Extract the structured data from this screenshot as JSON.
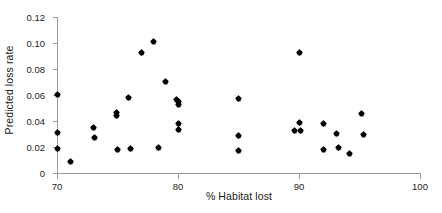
{
  "chart_data": {
    "type": "scatter",
    "title": "",
    "xlabel": "% Habitat lost",
    "ylabel": "Predicted loss rate",
    "xlim": [
      70,
      100
    ],
    "ylim": [
      0,
      0.12
    ],
    "grid": false,
    "legend": null,
    "xticks": [
      70,
      80,
      90,
      100
    ],
    "xtick_labels": [
      "70",
      "80",
      "90",
      "100"
    ],
    "yticks": [
      0,
      0.02,
      0.04,
      0.06,
      0.08,
      0.1,
      0.12
    ],
    "ytick_labels": [
      "0",
      "0.02",
      "0.04",
      "0.06",
      "0.08",
      "0.10",
      "0.12"
    ],
    "marker": "diamond",
    "marker_color": "#000000",
    "axis_color": "#9a9a9a",
    "points": [
      {
        "x": 70.0,
        "y": 0.0605
      },
      {
        "x": 70.0,
        "y": 0.031
      },
      {
        "x": 70.0,
        "y": 0.019
      },
      {
        "x": 71.1,
        "y": 0.0088
      },
      {
        "x": 73.0,
        "y": 0.0353
      },
      {
        "x": 73.1,
        "y": 0.0273
      },
      {
        "x": 74.9,
        "y": 0.0463
      },
      {
        "x": 74.9,
        "y": 0.0443
      },
      {
        "x": 75.0,
        "y": 0.0177
      },
      {
        "x": 75.9,
        "y": 0.0578
      },
      {
        "x": 76.1,
        "y": 0.0188
      },
      {
        "x": 77.0,
        "y": 0.0928
      },
      {
        "x": 78.0,
        "y": 0.1008
      },
      {
        "x": 78.4,
        "y": 0.0197
      },
      {
        "x": 79.0,
        "y": 0.0703
      },
      {
        "x": 79.9,
        "y": 0.0568
      },
      {
        "x": 80.0,
        "y": 0.0548
      },
      {
        "x": 80.0,
        "y": 0.0528
      },
      {
        "x": 80.0,
        "y": 0.0383
      },
      {
        "x": 80.0,
        "y": 0.0338
      },
      {
        "x": 85.0,
        "y": 0.0573
      },
      {
        "x": 85.0,
        "y": 0.0292
      },
      {
        "x": 85.0,
        "y": 0.017
      },
      {
        "x": 89.6,
        "y": 0.033
      },
      {
        "x": 90.0,
        "y": 0.093
      },
      {
        "x": 90.0,
        "y": 0.0385
      },
      {
        "x": 90.1,
        "y": 0.033
      },
      {
        "x": 92.0,
        "y": 0.0377
      },
      {
        "x": 92.0,
        "y": 0.0177
      },
      {
        "x": 93.1,
        "y": 0.0305
      },
      {
        "x": 93.3,
        "y": 0.0198
      },
      {
        "x": 94.2,
        "y": 0.015
      },
      {
        "x": 95.2,
        "y": 0.0455
      },
      {
        "x": 95.3,
        "y": 0.0293
      }
    ]
  },
  "figure": {
    "x_axis_title": "% Habitat lost",
    "y_axis_title": "Predicted loss rate"
  }
}
